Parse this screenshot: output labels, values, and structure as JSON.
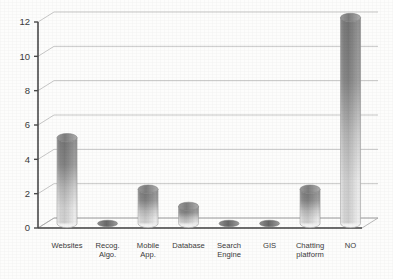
{
  "chart_data": {
    "type": "bar",
    "title": "",
    "subtitle": "",
    "xlabel": "",
    "ylabel": "",
    "categories": [
      "Websites",
      "Recog. Algo.",
      "Mobile App.",
      "Database",
      "Search Engine",
      "GIS",
      "Chatting platform",
      "NO"
    ],
    "category_lines": [
      [
        "Websites"
      ],
      [
        "Recog.",
        "Algo."
      ],
      [
        "Mobile",
        "App."
      ],
      [
        "Database"
      ],
      [
        "Search",
        "Engine"
      ],
      [
        "GIS"
      ],
      [
        "Chatting",
        "platform"
      ],
      [
        "NO"
      ]
    ],
    "values": [
      5,
      0,
      2,
      1,
      0,
      0,
      2,
      12
    ],
    "ylim": [
      0,
      13
    ],
    "yticks": [
      0,
      2,
      4,
      6,
      8,
      10,
      12
    ],
    "ytick_labels": [
      "0",
      "2",
      "4",
      "6",
      "8",
      "10",
      "12"
    ],
    "grid": true,
    "legend": false,
    "legend_position": "none",
    "style": "3d-cylinder",
    "colors": {
      "bar_top": "#6e6e6e",
      "bar_bottom": "#e8e8e8",
      "bar_cap": "#8a8a8a",
      "gridline": "#b9b9b9",
      "axis": "#4a4a4a",
      "background": "#ffffff",
      "text": "#3a3a3a"
    }
  }
}
